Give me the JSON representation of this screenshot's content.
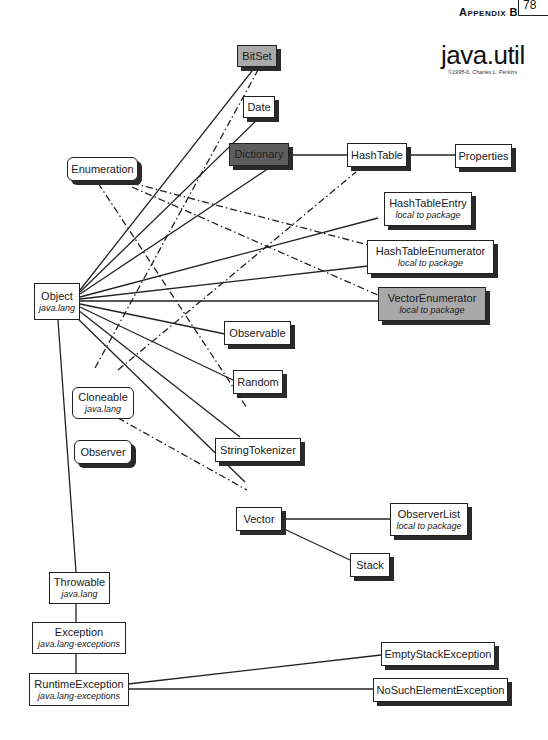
{
  "header": {
    "appendix_label": "Appendix B",
    "tab_text": "78"
  },
  "title": {
    "package": "java.util",
    "credit": "©1995-6, Charles L. Perkins"
  },
  "nodes": {
    "bitset": {
      "label": "BitSet",
      "style": "gray"
    },
    "date": {
      "label": "Date"
    },
    "dictionary": {
      "label": "Dictionary",
      "style": "dark"
    },
    "hashtable": {
      "label": "HashTable"
    },
    "properties": {
      "label": "Properties"
    },
    "enumeration": {
      "label": "Enumeration",
      "kind": "interface"
    },
    "hashtableentry": {
      "label": "HashTableEntry",
      "sub": "local to package"
    },
    "hashtableenumerator": {
      "label": "HashTableEnumerator",
      "sub": "local to package"
    },
    "vectorenumerator": {
      "label": "VectorEnumerator",
      "sub": "local to package",
      "style": "gray"
    },
    "object": {
      "label": "Object",
      "sub": "java.lang"
    },
    "observable": {
      "label": "Observable"
    },
    "random": {
      "label": "Random"
    },
    "cloneable": {
      "label": "Cloneable",
      "sub": "java.lang",
      "kind": "interface"
    },
    "observer": {
      "label": "Observer",
      "kind": "interface"
    },
    "stringtokenizer": {
      "label": "StringTokenizer"
    },
    "vector": {
      "label": "Vector"
    },
    "observerlist": {
      "label": "ObserverList",
      "sub": "local to package"
    },
    "stack": {
      "label": "Stack"
    },
    "throwable": {
      "label": "Throwable",
      "sub": "java.lang"
    },
    "exception": {
      "label": "Exception",
      "sub": "java.lang-exceptions"
    },
    "runtimeexception": {
      "label": "RuntimeException",
      "sub": "java.lang-exceptions"
    },
    "emptystackexception": {
      "label": "EmptyStackException"
    },
    "nosuchelementexception": {
      "label": "NoSuchElementException"
    }
  },
  "edges": {
    "inheritance": [
      [
        "Object",
        "BitSet"
      ],
      [
        "Object",
        "Date"
      ],
      [
        "Object",
        "Dictionary"
      ],
      [
        "Dictionary",
        "HashTable"
      ],
      [
        "HashTable",
        "Properties"
      ],
      [
        "Object",
        "HashTableEntry"
      ],
      [
        "Object",
        "HashTableEnumerator"
      ],
      [
        "Object",
        "VectorEnumerator"
      ],
      [
        "Object",
        "Observable"
      ],
      [
        "Object",
        "Random"
      ],
      [
        "Object",
        "StringTokenizer"
      ],
      [
        "Object",
        "Vector"
      ],
      [
        "Vector",
        "ObserverList"
      ],
      [
        "Vector",
        "Stack"
      ],
      [
        "Object",
        "Throwable"
      ],
      [
        "Throwable",
        "Exception"
      ],
      [
        "Exception",
        "RuntimeException"
      ],
      [
        "RuntimeException",
        "EmptyStackException"
      ],
      [
        "RuntimeException",
        "NoSuchElementException"
      ]
    ],
    "implements": [
      [
        "Enumeration",
        "HashTableEnumerator"
      ],
      [
        "Enumeration",
        "VectorEnumerator"
      ],
      [
        "Enumeration",
        "StringTokenizer"
      ],
      [
        "Cloneable",
        "BitSet"
      ],
      [
        "Cloneable",
        "HashTable"
      ],
      [
        "Cloneable",
        "Vector"
      ]
    ]
  },
  "colors": {
    "line": "#222222",
    "gray_box": "#a9a9a9",
    "dark_box": "#5e5e5e",
    "shadow": "#2a2a2a"
  }
}
